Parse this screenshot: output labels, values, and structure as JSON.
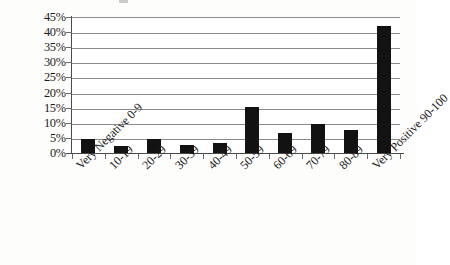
{
  "chart_data": {
    "type": "bar",
    "title": "",
    "subtitle": "",
    "xlabel": "",
    "ylabel": "",
    "categories": [
      "Very Negative 0-9",
      "10-19",
      "20-29",
      "30-39",
      "40-49",
      "50-59",
      "60-69",
      "70-79",
      "80-89",
      "Very Positive 90-100"
    ],
    "values": [
      5.0,
      2.5,
      5.0,
      3.0,
      3.5,
      15.5,
      7.0,
      10.0,
      8.0,
      42.5
    ],
    "value_labels": [
      "5%",
      "2.5%",
      "5%",
      "3%",
      "3.5%",
      "15.5%",
      "7%",
      "10%",
      "8%",
      "42.5%"
    ],
    "ylim": [
      0,
      45
    ],
    "ytick_labels": [
      "45%",
      "40%",
      "35%",
      "30%",
      "25%",
      "20%",
      "15%",
      "10%",
      "5%",
      "0%"
    ],
    "ytick_values": [
      45,
      40,
      35,
      30,
      25,
      20,
      15,
      10,
      5,
      0
    ],
    "grid": "horizontal",
    "legend": "none",
    "bar_color": "#121212",
    "gridline_color": "#8a8a8a",
    "axis_color": "#4a4a4a",
    "background_color": "#ffffff",
    "xtick_label_rotation": "-45"
  }
}
